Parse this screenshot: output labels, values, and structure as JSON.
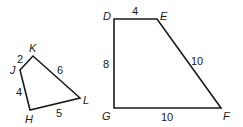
{
  "figures": [
    {
      "name": "quadrilateral-HJKL",
      "vertices": {
        "J": {
          "label": "J",
          "x": 20,
          "y": 70
        },
        "K": {
          "label": "K",
          "x": 33,
          "y": 56
        },
        "L": {
          "label": "L",
          "x": 80,
          "y": 98
        },
        "H": {
          "label": "H",
          "x": 30,
          "y": 110
        }
      },
      "sides": {
        "JK": "2",
        "KL": "6",
        "LH": "5",
        "HJ": "4"
      }
    },
    {
      "name": "quadrilateral-DEFG",
      "vertices": {
        "D": {
          "label": "D",
          "x": 114,
          "y": 19
        },
        "E": {
          "label": "E",
          "x": 157,
          "y": 19
        },
        "F": {
          "label": "F",
          "x": 221,
          "y": 108
        },
        "G": {
          "label": "G",
          "x": 114,
          "y": 108
        }
      },
      "sides": {
        "DE": "4",
        "EF": "10",
        "FG": "10",
        "GD": "8"
      }
    }
  ]
}
